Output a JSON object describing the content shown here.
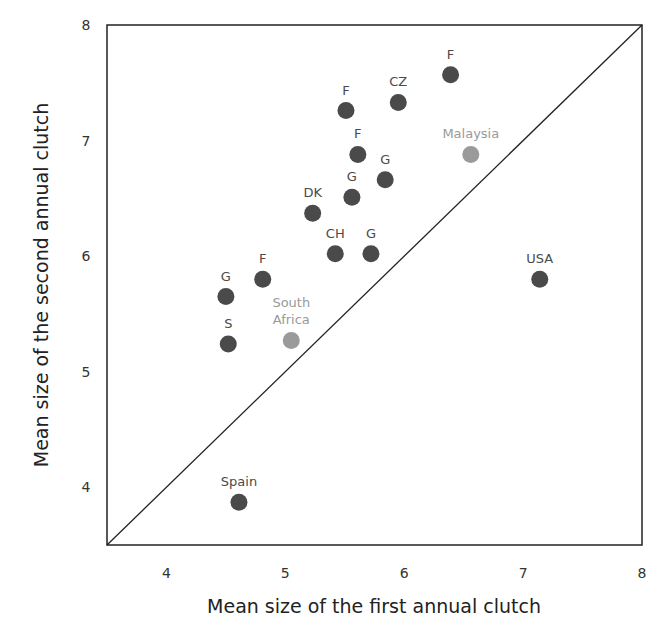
{
  "chart_data": {
    "type": "scatter",
    "title": "",
    "xlabel": "Mean size of the first annual clutch",
    "ylabel": "Mean size of the second annual clutch",
    "xlim": [
      3.5,
      8
    ],
    "ylim": [
      3.5,
      8
    ],
    "xticks": [
      4,
      5,
      6,
      7,
      8
    ],
    "yticks": [
      4,
      5,
      6,
      7,
      8
    ],
    "grid": false,
    "legend": null,
    "reference_line": {
      "type": "identity",
      "from": [
        3.5,
        3.5
      ],
      "to": [
        8,
        8
      ]
    },
    "colors": {
      "default": "#4a4a4a",
      "highlight": "#9a9a9a",
      "frame": "#222222"
    },
    "points": [
      {
        "label": "F",
        "x": 6.39,
        "y": 7.57,
        "highlight": false
      },
      {
        "label": "CZ",
        "x": 5.95,
        "y": 7.33,
        "highlight": false
      },
      {
        "label": "F",
        "x": 5.51,
        "y": 7.26,
        "highlight": false
      },
      {
        "label": "F",
        "x": 5.61,
        "y": 6.88,
        "highlight": false
      },
      {
        "label": "G",
        "x": 5.84,
        "y": 6.66,
        "highlight": false
      },
      {
        "label": "G",
        "x": 5.56,
        "y": 6.51,
        "highlight": false
      },
      {
        "label": "DK",
        "x": 5.23,
        "y": 6.37,
        "highlight": false
      },
      {
        "label": "CH",
        "x": 5.42,
        "y": 6.02,
        "highlight": false
      },
      {
        "label": "G",
        "x": 5.72,
        "y": 6.02,
        "highlight": false
      },
      {
        "label": "F",
        "x": 4.81,
        "y": 5.8,
        "highlight": false
      },
      {
        "label": "G",
        "x": 4.5,
        "y": 5.65,
        "highlight": false
      },
      {
        "label": "S",
        "x": 4.52,
        "y": 5.24,
        "highlight": false
      },
      {
        "label": "South Africa",
        "x": 5.05,
        "y": 5.27,
        "highlight": true
      },
      {
        "label": "Malaysia",
        "x": 6.56,
        "y": 6.88,
        "highlight": true
      },
      {
        "label": "USA",
        "x": 7.14,
        "y": 5.8,
        "highlight": false
      },
      {
        "label": "Spain",
        "x": 4.61,
        "y": 3.87,
        "highlight": false
      }
    ]
  }
}
